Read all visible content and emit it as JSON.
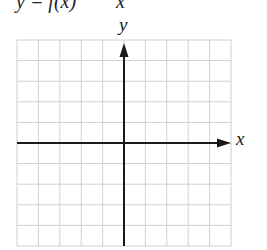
{
  "header": {
    "function_label": "y = f(x)",
    "partial_term": "x"
  },
  "axes": {
    "x_label": "x",
    "y_label": "y"
  },
  "grid": {
    "columns": 10,
    "rows": 10,
    "left": 17,
    "top": 40,
    "right": 231,
    "bottom": 246,
    "origin_col": 5,
    "origin_row": 5,
    "grid_color": "#d0d0d0",
    "axis_color": "#1a1a1a"
  }
}
